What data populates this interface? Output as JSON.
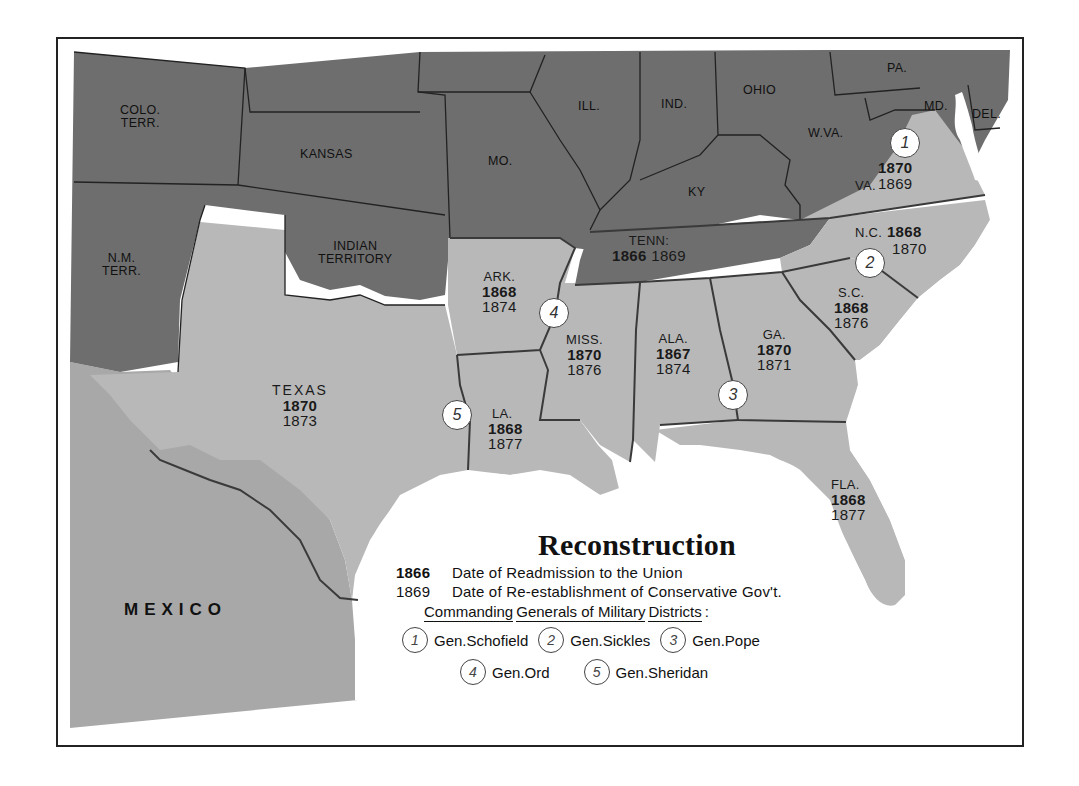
{
  "map": {
    "title": "Reconstruction",
    "colors": {
      "unreconstructed_states": "#6e6e6e",
      "former_confederate_states": "#b8b8b8",
      "mexico": "#a8a8a8",
      "water": "#ffffff",
      "border": "#222222"
    },
    "non_confederate_regions": [
      {
        "id": "colo",
        "label_line1": "COLO.",
        "label_line2": "TERR."
      },
      {
        "id": "kansas",
        "label_line1": "KANSAS",
        "label_line2": ""
      },
      {
        "id": "mo",
        "label_line1": "MO.",
        "label_line2": ""
      },
      {
        "id": "ill",
        "label_line1": "ILL.",
        "label_line2": ""
      },
      {
        "id": "ind",
        "label_line1": "IND.",
        "label_line2": ""
      },
      {
        "id": "ohio",
        "label_line1": "OHIO",
        "label_line2": ""
      },
      {
        "id": "pa",
        "label_line1": "PA.",
        "label_line2": ""
      },
      {
        "id": "md",
        "label_line1": "MD.",
        "label_line2": ""
      },
      {
        "id": "del",
        "label_line1": "DEL.",
        "label_line2": ""
      },
      {
        "id": "wva",
        "label_line1": "W.VA.",
        "label_line2": ""
      },
      {
        "id": "ky",
        "label_line1": "KY",
        "label_line2": ""
      },
      {
        "id": "nm",
        "label_line1": "N.M.",
        "label_line2": "TERR."
      },
      {
        "id": "indian",
        "label_line1": "INDIAN",
        "label_line2": "TERRITORY"
      },
      {
        "id": "mexico",
        "label_line1": "MEXICO",
        "label_line2": ""
      }
    ],
    "states": [
      {
        "id": "va",
        "name": "VA.",
        "readmission": "1870",
        "conservative_gov": "1869"
      },
      {
        "id": "nc",
        "name": "N.C.",
        "readmission": "1868",
        "conservative_gov": "1870"
      },
      {
        "id": "tenn",
        "name": "TENN:",
        "readmission": "1866",
        "conservative_gov": "1869"
      },
      {
        "id": "ark",
        "name": "ARK.",
        "readmission": "1868",
        "conservative_gov": "1874"
      },
      {
        "id": "sc",
        "name": "S.C.",
        "readmission": "1868",
        "conservative_gov": "1876"
      },
      {
        "id": "miss",
        "name": "MISS.",
        "readmission": "1870",
        "conservative_gov": "1876"
      },
      {
        "id": "ala",
        "name": "ALA.",
        "readmission": "1867",
        "conservative_gov": "1874"
      },
      {
        "id": "ga",
        "name": "GA.",
        "readmission": "1870",
        "conservative_gov": "1871"
      },
      {
        "id": "texas",
        "name": "TEXAS",
        "readmission": "1870",
        "conservative_gov": "1873"
      },
      {
        "id": "la",
        "name": "LA.",
        "readmission": "1868",
        "conservative_gov": "1877"
      },
      {
        "id": "fla",
        "name": "FLA.",
        "readmission": "1868",
        "conservative_gov": "1877"
      }
    ],
    "district_markers": [
      {
        "number": "1",
        "location": "VA."
      },
      {
        "number": "2",
        "location": "N.C./S.C."
      },
      {
        "number": "3",
        "location": "GA./ALA."
      },
      {
        "number": "4",
        "location": "ARK./MISS."
      },
      {
        "number": "5",
        "location": "LA./TEXAS"
      }
    ]
  },
  "legend": {
    "title": "Reconstruction",
    "bold_year_example": "1866",
    "bold_year_meaning": "Date of Readmission to the Union",
    "plain_year_example": "1869",
    "plain_year_meaning": "Date of Re-establishment of Conservative Gov't.",
    "generals_heading_words": [
      "Commanding",
      "Generals of Military",
      "Districts"
    ],
    "generals_heading_suffix": ":",
    "generals": [
      {
        "number": "1",
        "name": "Gen.Schofield"
      },
      {
        "number": "2",
        "name": "Gen.Sickles"
      },
      {
        "number": "3",
        "name": "Gen.Pope"
      },
      {
        "number": "4",
        "name": "Gen.Ord"
      },
      {
        "number": "5",
        "name": "Gen.Sheridan"
      }
    ]
  }
}
